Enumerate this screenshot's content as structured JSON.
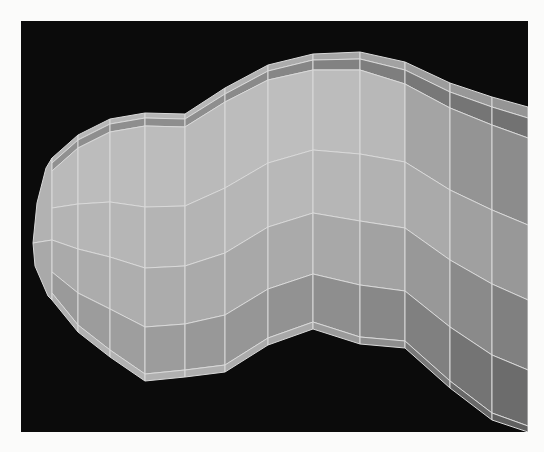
{
  "figure": {
    "page_bg": "#fbfbfa",
    "viewport": {
      "x": 21,
      "y": 21,
      "width": 507,
      "height": 411,
      "bg": "#0b0b0b"
    },
    "mesh": {
      "stroke": "#d9d9d9",
      "stroke_width": 1,
      "tip_faces": [
        {
          "fill": "#b2b2b2",
          "points": [
            [
              33,
              243
            ],
            [
              37,
              203
            ],
            [
              46,
              168
            ],
            [
              52,
              158
            ],
            [
              52,
              240
            ]
          ]
        },
        {
          "fill": "#a9a9a9",
          "points": [
            [
              33,
              243
            ],
            [
              52,
              240
            ],
            [
              52,
              300
            ],
            [
              48,
              296
            ],
            [
              35,
              266
            ]
          ]
        }
      ],
      "columns": [
        {
          "x": 52,
          "ys": [
            158,
            163,
            171,
            208,
            240,
            272,
            293,
            300
          ]
        },
        {
          "x": 78,
          "ys": [
            135,
            140,
            148,
            204,
            249,
            293,
            325,
            332
          ]
        },
        {
          "x": 110,
          "ys": [
            119,
            124,
            132,
            202,
            257,
            309,
            350,
            357
          ]
        },
        {
          "x": 145,
          "ys": [
            113,
            118,
            126,
            207,
            268,
            327,
            374,
            381
          ]
        },
        {
          "x": 185,
          "ys": [
            114,
            119,
            127,
            206,
            266,
            324,
            370,
            377
          ]
        },
        {
          "x": 225,
          "ys": [
            88,
            94,
            102,
            188,
            253,
            315,
            365,
            372
          ]
        },
        {
          "x": 268,
          "ys": [
            65,
            71,
            80,
            163,
            227,
            289,
            338,
            345
          ]
        },
        {
          "x": 313,
          "ys": [
            54,
            60,
            70,
            150,
            213,
            274,
            322,
            329
          ]
        },
        {
          "x": 360,
          "ys": [
            52,
            59,
            70,
            154,
            221,
            285,
            337,
            344
          ]
        },
        {
          "x": 405,
          "ys": [
            62,
            70,
            84,
            162,
            228,
            291,
            341,
            348
          ]
        },
        {
          "x": 450,
          "ys": [
            83,
            92,
            108,
            190,
            260,
            327,
            381,
            388
          ]
        },
        {
          "x": 492,
          "ys": [
            97,
            107,
            125,
            210,
            284,
            355,
            413,
            420
          ]
        },
        {
          "x": 528,
          "ys": [
            107,
            118,
            138,
            225,
            300,
            370,
            426,
            432
          ]
        }
      ],
      "band_fills": [
        [
          "#b4b4b4",
          "#b6b6b6",
          "#b6b6b6",
          "#b6b6b6",
          "#b6b6b6",
          "#b2b2b2",
          "#acacac",
          "#a6a6a6",
          "#a2a2a2",
          "#9c9c9c",
          "#989898",
          "#959595"
        ],
        [
          "#909090",
          "#8e8e8e",
          "#8e8e8e",
          "#8e8e8e",
          "#8e8e8e",
          "#8a8a8a",
          "#868686",
          "#828282",
          "#7e7e7e",
          "#787878",
          "#757575",
          "#727272"
        ],
        [
          "#bababa",
          "#bcbcbc",
          "#bcbcbc",
          "#bcbcbc",
          "#bababa",
          "#bcbcbc",
          "#bebebe",
          "#bcbcbc",
          "#b8b8b8",
          "#a4a4a4",
          "#949494",
          "#8c8c8c"
        ],
        [
          "#b4b4b4",
          "#b6b6b6",
          "#b6b6b6",
          "#b4b4b4",
          "#b4b4b4",
          "#b6b6b6",
          "#b8b8b8",
          "#b6b6b6",
          "#b2b2b2",
          "#aaaaaa",
          "#a0a0a0",
          "#989898"
        ],
        [
          "#aaaaaa",
          "#acacac",
          "#aeaeae",
          "#acacac",
          "#aaaaaa",
          "#a8a8a8",
          "#aaaaaa",
          "#a8a8a8",
          "#a2a2a2",
          "#989898",
          "#8a8a8a",
          "#808080"
        ],
        [
          "#9a9a9a",
          "#9c9c9c",
          "#9e9e9e",
          "#9c9c9c",
          "#989898",
          "#969696",
          "#929292",
          "#8e8e8e",
          "#888888",
          "#808080",
          "#747474",
          "#6c6c6c"
        ],
        [
          "#b0b0b0",
          "#b2b2b2",
          "#b2b2b2",
          "#b0b0b0",
          "#aeaeae",
          "#acacac",
          "#a8a8a8",
          "#9a9a9a",
          "#8e8e8e",
          "#787878",
          "#686868",
          "#606060"
        ]
      ]
    }
  }
}
